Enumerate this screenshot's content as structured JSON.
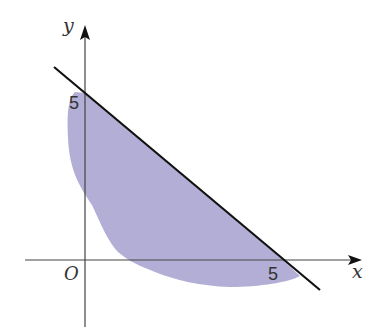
{
  "diagram": {
    "axes": {
      "x_label": "x",
      "y_label": "y",
      "origin_label": "O"
    },
    "ticks": {
      "x_intercept_label": "5",
      "y_intercept_label": "5"
    },
    "line": {
      "description": "x + y = 5",
      "x_intercept": 5,
      "y_intercept": 5,
      "color": "#111111"
    },
    "region": {
      "description": "Irregular shaded region bounded above-right by the line x + y = 5",
      "fill_color": "#aeaad3"
    },
    "colors": {
      "axis": "#444444",
      "line": "#111111",
      "shade": "#aeaad3",
      "background": "#ffffff"
    }
  }
}
